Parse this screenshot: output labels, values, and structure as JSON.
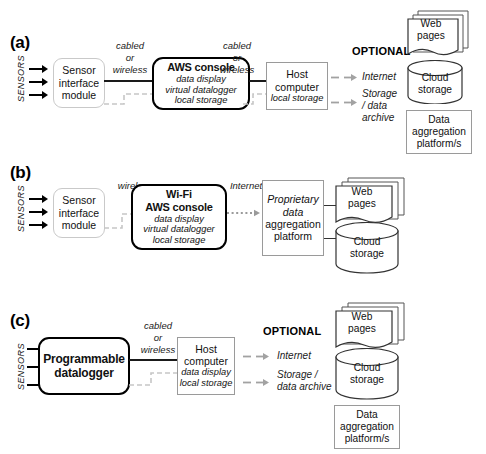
{
  "figure": {
    "colors": {
      "soft_border": "#c9c9c9",
      "square_border": "#9a9a9a",
      "heavy_border": "#000000",
      "cable_line": "#1a1a1a",
      "wireless_line": "#bdbdbd",
      "dashed_arrow": "#9a9a9a",
      "text": "#111111"
    }
  },
  "panels": [
    {
      "letter": "(a)",
      "sensors_label": "SENSORS",
      "sensor_arrow_count": 3,
      "blocks": {
        "sensor_interface": {
          "lines": [
            "Sensor",
            "interface",
            "module"
          ]
        },
        "aws_console": {
          "title": "AWS console",
          "sub": [
            "data display",
            "virtual datalogger",
            "local storage"
          ]
        },
        "host_computer": {
          "lines": [
            "Host",
            "computer"
          ],
          "sub": [
            "local storage"
          ]
        }
      },
      "connectors": [
        {
          "label": [
            "cabled",
            "or",
            "wireless"
          ]
        },
        {
          "label": [
            "cabled",
            "or",
            "wireless"
          ]
        }
      ],
      "optional_label": "OPTIONAL",
      "optional_destinations": [
        {
          "lines": [
            "Internet"
          ]
        },
        {
          "lines": [
            "Storage",
            "/ data",
            "archive"
          ]
        }
      ]
    },
    {
      "letter": "(b)",
      "sensors_label": "SENSORS",
      "sensor_arrow_count": 3,
      "blocks": {
        "sensor_interface": {
          "lines": [
            "Sensor",
            "interface",
            "module"
          ]
        },
        "aws_console": {
          "title_line1": "Wi-Fi",
          "title_line2": "AWS console",
          "sub": [
            "data display",
            "virtual datalogger",
            "local storage"
          ]
        },
        "proprietary_platform": {
          "lines": [
            "Proprietary",
            "data",
            "aggregation",
            "platform"
          ]
        }
      },
      "connectors": [
        {
          "label": [
            "wireless"
          ]
        },
        {
          "label": [
            "Internet"
          ]
        }
      ]
    },
    {
      "letter": "(c)",
      "sensors_label": "SENSORS",
      "sensor_arrow_count": 3,
      "blocks": {
        "programmable_datalogger": {
          "title_line1": "Programmable",
          "title_line2": "datalogger"
        },
        "host_computer": {
          "lines": [
            "Host",
            "computer"
          ],
          "sub": [
            "data display",
            "local storage"
          ]
        }
      },
      "connectors": [
        {
          "label": [
            "cabled",
            "or",
            "wireless"
          ]
        }
      ],
      "optional_label": "OPTIONAL",
      "optional_destinations": [
        {
          "lines": [
            "Internet"
          ]
        },
        {
          "lines": [
            "Storage /",
            "data archive"
          ]
        }
      ]
    }
  ],
  "stencils": {
    "web_pages": {
      "lines": [
        "Web",
        "pages"
      ],
      "shape": "document-stack"
    },
    "cloud_storage": {
      "lines": [
        "Cloud",
        "storage"
      ],
      "shape": "cylinder"
    },
    "data_aggregation": {
      "lines": [
        "Data",
        "aggregation",
        "platform/s"
      ],
      "shape": "rectangle"
    }
  }
}
